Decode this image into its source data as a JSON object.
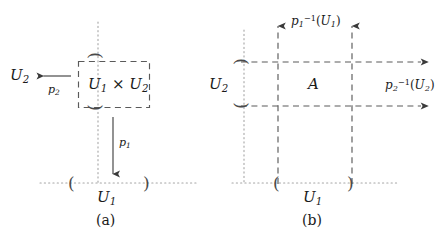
{
  "figure": {
    "stroke_color": "#4a4a4a",
    "dash_color": "#5a5a5a",
    "dot_color": "#9a9a9a",
    "text_color": "#1a1a1a",
    "background": "#ffffff"
  },
  "panel_a": {
    "caption": "(a)",
    "box_label": {
      "factor1": "U",
      "factor1_sub": "1",
      "operator": "×",
      "factor2": "U",
      "factor2_sub": "2"
    },
    "axis_x_label": "U",
    "axis_x_sub": "1",
    "axis_y_label": "U",
    "axis_y_sub": "2",
    "projection_down": "p",
    "projection_down_sub": "1",
    "projection_left": "p",
    "projection_left_sub": "2",
    "bracket_open": "(",
    "bracket_close": ")"
  },
  "panel_b": {
    "caption": "(b)",
    "region_label": "A",
    "axis_x_label": "U",
    "axis_x_sub": "1",
    "axis_y_label": "U",
    "axis_y_sub": "2",
    "preimage_vertical": {
      "map": "p",
      "map_sub": "1",
      "map_sup": "−1",
      "open": "(",
      "arg": "U",
      "arg_sub": "1",
      "close": ")"
    },
    "preimage_horizontal": {
      "map": "p",
      "map_sub": "2",
      "map_sup": "−1",
      "open": "(",
      "arg": "U",
      "arg_sub": "2",
      "close": ")"
    },
    "bracket_open": "(",
    "bracket_close": ")"
  }
}
